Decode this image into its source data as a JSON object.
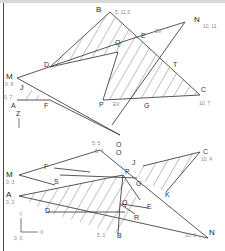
{
  "drawing": {
    "title": "Intersection of planes — two orthographic views",
    "top_view": {
      "points": {
        "B": {
          "label": "B",
          "coord": "5, 11.5"
        },
        "N": {
          "label": "N",
          "coord": "10, 11"
        },
        "E": {
          "label": "E",
          "ev": "EV"
        },
        "Q": {
          "label": "Q"
        },
        "T": {
          "label": "T"
        },
        "C": {
          "label": "C",
          "coord": "10, 7"
        },
        "G": {
          "label": "G"
        },
        "P": {
          "label": "P",
          "ev": "EV"
        },
        "D": {
          "label": "D"
        },
        "M": {
          "label": "M",
          "coord": "0, 8"
        },
        "J": {
          "label": "J"
        },
        "A": {
          "label": "A",
          "coord": "0, 7"
        },
        "F": {
          "label": "F"
        },
        "O": {
          "label": "O",
          "coord": "5, 5"
        }
      },
      "axis_label": "Z"
    },
    "front_view": {
      "points": {
        "O": {
          "label": "O",
          "coord": "5, 4"
        },
        "C": {
          "label": "C",
          "coord": "10, 4"
        },
        "J": {
          "label": "J"
        },
        "G": {
          "label": "G"
        },
        "K": {
          "label": "K"
        },
        "M": {
          "label": "M",
          "coord": "0, 3"
        },
        "F": {
          "label": "F"
        },
        "P": {
          "label": "P"
        },
        "S": {
          "label": "S"
        },
        "A": {
          "label": "A",
          "coord": "0, 2"
        },
        "D": {
          "label": "D"
        },
        "Q": {
          "label": "Q"
        },
        "E": {
          "label": "E"
        },
        "R": {
          "label": "R"
        },
        "B": {
          "label": "B",
          "coord": "5, 0"
        },
        "N": {
          "label": "N",
          "coord": "10, 0"
        }
      },
      "axis": {
        "y": "Y",
        "x": "X",
        "origin": "0, 0"
      }
    }
  }
}
